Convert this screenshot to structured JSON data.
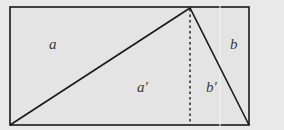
{
  "diagram": {
    "labels": {
      "a": "a",
      "b": "b",
      "a_prime": "a′",
      "b_prime": "b′"
    },
    "colors": {
      "background": "#e9e9e9",
      "fill": "#e4e4e4",
      "stroke": "#1a1a1a"
    }
  }
}
